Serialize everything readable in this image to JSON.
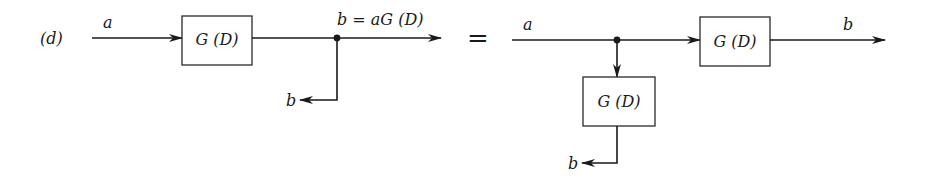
{
  "figure": {
    "part_label": "(d)",
    "equals_sign": "=",
    "left_diagram": {
      "input_label": "a",
      "block_label": "G (D)",
      "output_label": "b = aG (D)",
      "branch_output_label": "b"
    },
    "right_diagram": {
      "input_label": "a",
      "upper_block_label": "G (D)",
      "lower_block_label": "G (D)",
      "output_label": "b",
      "branch_output_label": "b"
    },
    "colors": {
      "ink": "#1a1a1a",
      "background": "#ffffff"
    }
  }
}
